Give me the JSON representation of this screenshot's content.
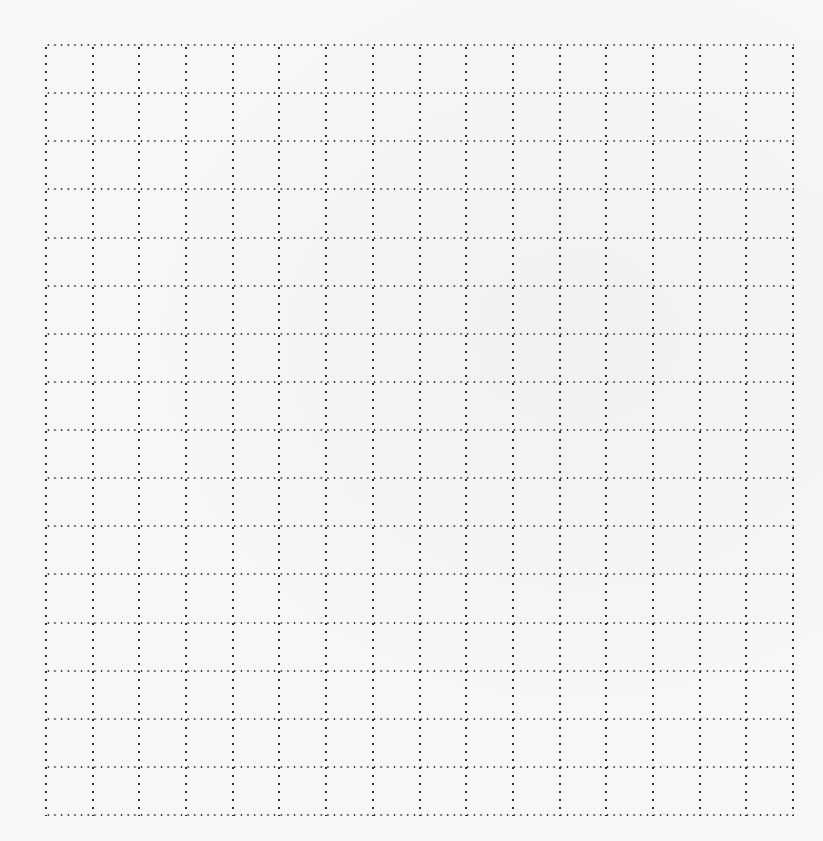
{
  "page": {
    "background_color": "#f7f7f5",
    "dot_color": "#2e2e2e"
  },
  "grid": {
    "columns": 16,
    "rows": 16,
    "left": 46,
    "top": 45,
    "width": 747,
    "height": 770,
    "line_style": "dotted"
  }
}
